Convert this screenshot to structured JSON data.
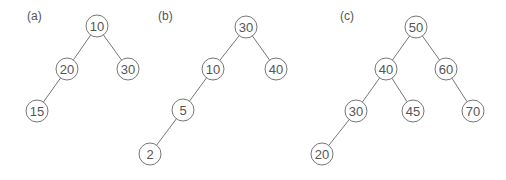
{
  "diagram": {
    "type": "binary-trees",
    "colors": {
      "stroke": "#777777",
      "text": "#555555",
      "background": "#ffffff"
    },
    "node_radius": 11,
    "panels": [
      {
        "label": "(a)",
        "label_pos": [
          27,
          20
        ],
        "nodes": [
          {
            "id": "a10",
            "value": "10",
            "x": 97,
            "y": 26
          },
          {
            "id": "a20",
            "value": "20",
            "x": 67,
            "y": 69
          },
          {
            "id": "a30",
            "value": "30",
            "x": 128,
            "y": 69
          },
          {
            "id": "a15",
            "value": "15",
            "x": 37,
            "y": 111
          }
        ],
        "edges": [
          [
            "a10",
            "a20"
          ],
          [
            "a10",
            "a30"
          ],
          [
            "a20",
            "a15"
          ]
        ]
      },
      {
        "label": "(b)",
        "label_pos": [
          158,
          20
        ],
        "nodes": [
          {
            "id": "b30",
            "value": "30",
            "x": 246,
            "y": 27
          },
          {
            "id": "b10",
            "value": "10",
            "x": 213,
            "y": 69
          },
          {
            "id": "b40",
            "value": "40",
            "x": 276,
            "y": 69
          },
          {
            "id": "b5",
            "value": "5",
            "x": 183,
            "y": 110
          },
          {
            "id": "b2",
            "value": "2",
            "x": 150,
            "y": 154
          }
        ],
        "edges": [
          [
            "b30",
            "b10"
          ],
          [
            "b30",
            "b40"
          ],
          [
            "b10",
            "b5"
          ],
          [
            "b5",
            "b2"
          ]
        ]
      },
      {
        "label": "(c)",
        "label_pos": [
          340,
          20
        ],
        "nodes": [
          {
            "id": "c50",
            "value": "50",
            "x": 416,
            "y": 27
          },
          {
            "id": "c40",
            "value": "40",
            "x": 386,
            "y": 69
          },
          {
            "id": "c60",
            "value": "60",
            "x": 446,
            "y": 69
          },
          {
            "id": "c30",
            "value": "30",
            "x": 356,
            "y": 111
          },
          {
            "id": "c45",
            "value": "45",
            "x": 413,
            "y": 111
          },
          {
            "id": "c70",
            "value": "70",
            "x": 473,
            "y": 111
          },
          {
            "id": "c20",
            "value": "20",
            "x": 322,
            "y": 154
          }
        ],
        "edges": [
          [
            "c50",
            "c40"
          ],
          [
            "c50",
            "c60"
          ],
          [
            "c40",
            "c30"
          ],
          [
            "c40",
            "c45"
          ],
          [
            "c60",
            "c70"
          ],
          [
            "c30",
            "c20"
          ]
        ]
      }
    ]
  }
}
